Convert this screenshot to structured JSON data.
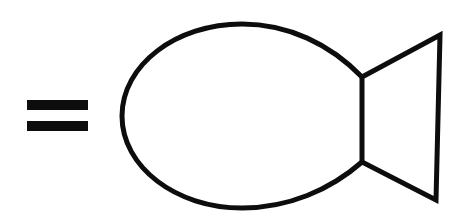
{
  "canvas": {
    "width": 465,
    "height": 216,
    "background_color": "#ffffff",
    "ink_color": "#0d0d0d",
    "stroke_width": 5
  },
  "figure": {
    "description": "Black line drawing of an equals sign followed by a fish outline",
    "kind": "line-art"
  },
  "equals_sign": {
    "glyph": "=",
    "bar_count": 2,
    "bars": [
      {
        "name": "top-bar",
        "x": 27,
        "y": 100,
        "width": 61,
        "height": 10
      },
      {
        "name": "bottom-bar",
        "x": 27,
        "y": 121,
        "width": 61,
        "height": 10
      }
    ]
  },
  "fish": {
    "body": {
      "name": "oval-body",
      "path": "M 362 77 C 330 44 288 24 242 24 C 176 24 122 65 122 116 C 122 167 176 208 242 208 C 288 208 330 190 362 162",
      "leftmost_x": 122,
      "top_y": 24,
      "bottom_y": 208,
      "center_y": 116
    },
    "tail": {
      "name": "triangular-tail",
      "path": "M 362 77 L 440 35 L 436 200 L 362 162 Z",
      "notch_top": {
        "x": 362,
        "y": 77
      },
      "notch_bottom": {
        "x": 362,
        "y": 162
      },
      "tip_top": {
        "x": 440,
        "y": 35
      },
      "tip_bottom": {
        "x": 436,
        "y": 200
      }
    }
  }
}
